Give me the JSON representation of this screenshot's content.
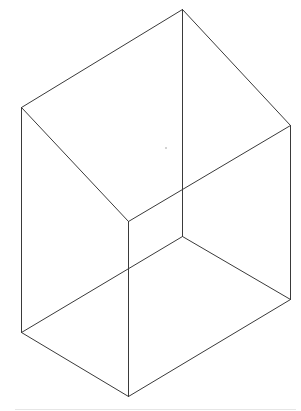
{
  "diagram": {
    "type": "wireframe-isometric-box",
    "stroke_color": "#3a3a3a",
    "stroke_width": 1,
    "background": "#ffffff",
    "vertices": {
      "top_back": [
        182,
        9
      ],
      "top_left": [
        21,
        107
      ],
      "top_right": [
        290,
        125
      ],
      "top_front": [
        128,
        221
      ],
      "bottom_back": [
        182,
        236
      ],
      "bottom_left": [
        21,
        332
      ],
      "bottom_right": [
        290,
        299
      ],
      "bottom_front": [
        128,
        396
      ]
    },
    "edges": [
      {
        "name": "top-left-back-edge",
        "from": "top_back",
        "to": "top_left"
      },
      {
        "name": "top-right-back-edge",
        "from": "top_back",
        "to": "top_right"
      },
      {
        "name": "top-left-front-edge",
        "from": "top_left",
        "to": "top_front"
      },
      {
        "name": "top-right-front-edge",
        "from": "top_right",
        "to": "top_front"
      },
      {
        "name": "vertical-back-edge",
        "from": "top_back",
        "to": "bottom_back"
      },
      {
        "name": "vertical-left-edge",
        "from": "top_left",
        "to": "bottom_left"
      },
      {
        "name": "vertical-right-edge",
        "from": "top_right",
        "to": "bottom_right"
      },
      {
        "name": "vertical-front-edge",
        "from": "top_front",
        "to": "bottom_front"
      },
      {
        "name": "bottom-left-back-edge",
        "from": "bottom_back",
        "to": "bottom_left"
      },
      {
        "name": "bottom-right-back-edge",
        "from": "bottom_back",
        "to": "bottom_right"
      },
      {
        "name": "bottom-left-front-edge",
        "from": "bottom_left",
        "to": "bottom_front"
      },
      {
        "name": "bottom-right-front-edge",
        "from": "bottom_right",
        "to": "bottom_front"
      }
    ],
    "artifacts": {
      "stray_dot": [
        166,
        148
      ],
      "baseline": {
        "y": 409,
        "x1": 15,
        "x2": 296,
        "color": "#e6e6e6"
      }
    }
  }
}
